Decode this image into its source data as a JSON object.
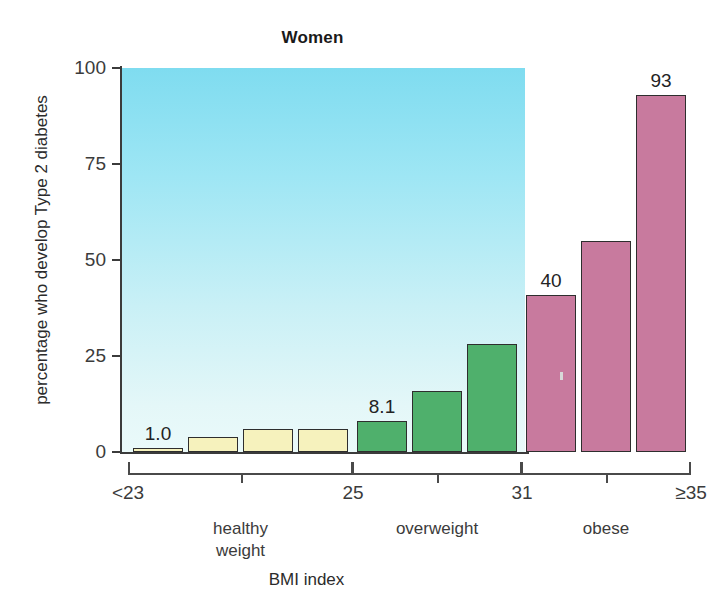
{
  "chart_data": {
    "type": "bar",
    "title": "Women",
    "xlabel": "BMI index",
    "ylabel": "percentage who develop Type 2 diabetes",
    "ylim": [
      0,
      100
    ],
    "yticks": [
      0,
      25,
      50,
      75,
      100
    ],
    "ytick_labels": [
      "0",
      "25",
      "50",
      "75",
      "100"
    ],
    "grid": false,
    "legend": "none",
    "categories": [
      "<23",
      "23-24",
      "24-25",
      "25",
      "25-27",
      "27-29",
      "29-31",
      "31",
      "32-34",
      ">=35"
    ],
    "values": [
      1.0,
      4,
      6,
      6,
      8.1,
      16,
      28,
      41,
      55,
      93
    ],
    "bar_colors": [
      "#f6f2bd",
      "#f6f2bd",
      "#f6f2bd",
      "#f6f2bd",
      "#4fb06c",
      "#4fb06c",
      "#4fb06c",
      "#c87a9e",
      "#c87a9e",
      "#c87a9e"
    ],
    "bars": [
      {
        "index": 0,
        "value": 1.0,
        "color_group": "yellow",
        "label": "1.0",
        "labeled": true
      },
      {
        "index": 1,
        "value": 4,
        "color_group": "yellow",
        "label": "",
        "labeled": false
      },
      {
        "index": 2,
        "value": 6,
        "color_group": "yellow",
        "label": "",
        "labeled": false
      },
      {
        "index": 3,
        "value": 6,
        "color_group": "yellow",
        "label": "",
        "labeled": false
      },
      {
        "index": 4,
        "value": 8.1,
        "color_group": "green",
        "label": "8.1",
        "labeled": true
      },
      {
        "index": 5,
        "value": 16,
        "color_group": "green",
        "label": "",
        "labeled": false
      },
      {
        "index": 6,
        "value": 28,
        "color_group": "green",
        "label": "",
        "labeled": false
      },
      {
        "index": 7,
        "value": 41,
        "color_group": "pink",
        "label": "40",
        "labeled": true
      },
      {
        "index": 8,
        "value": 55,
        "color_group": "pink",
        "label": "",
        "labeled": false
      },
      {
        "index": 9,
        "value": 93,
        "color_group": "pink",
        "label": "93",
        "labeled": true
      }
    ],
    "data_labels": [
      "1.0",
      "8.1",
      "40",
      "93"
    ],
    "xtick_labels": [
      "<23",
      "25",
      "31",
      "≥35"
    ],
    "groups": [
      {
        "name": "healthy weight",
        "label": "healthy\nweight",
        "bar_start": 0,
        "bar_end": 3,
        "color": "#f6f2bd"
      },
      {
        "name": "overweight",
        "label": "overweight",
        "bar_start": 4,
        "bar_end": 6,
        "color": "#4fb06c"
      },
      {
        "name": "obese",
        "label": "obese",
        "bar_start": 7,
        "bar_end": 9,
        "color": "#c87a9e"
      }
    ],
    "plot_background": "cyan gradient",
    "colors": {
      "yellow": "#f6f2bd",
      "green": "#4fb06c",
      "pink": "#c87a9e",
      "plot_bg_top": "#7fdcf0",
      "plot_bg_bottom": "#eafafa",
      "axis": "#3b3b3b",
      "text": "#2b2b2b"
    }
  }
}
